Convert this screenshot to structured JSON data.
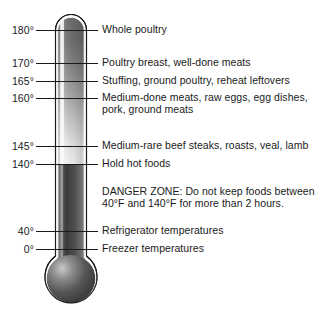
{
  "figure": {
    "background_color": "#ffffff",
    "text_color": "#1a1a1a"
  },
  "thermometer": {
    "outline_color": "#1a1a1a",
    "tube_top_color": "#6a6a6a",
    "tube_mid_color": "#f2f2f2",
    "tube_bottom_color": "#4a4a4a",
    "highlight_color": "#f5f5f5",
    "bulb_color": "#4a4a4a",
    "bulb_highlight_color": "#d8d8d8",
    "scale_unit": "°"
  },
  "readings": [
    {
      "temperature": "180°",
      "description": "Whole poultry",
      "y": 30
    },
    {
      "temperature": "170°",
      "description": "Poultry breast, well-done meats",
      "y": 63
    },
    {
      "temperature": "165°",
      "description": "Stuffing, ground poultry, reheat leftovers",
      "y": 81
    },
    {
      "temperature": "160°",
      "description": "Medium-done meats, raw eggs, egg dishes,\npork, ground meats",
      "y": 98
    },
    {
      "temperature": "145°",
      "description": "Medium-rare beef steaks, roasts, veal, lamb",
      "y": 146
    },
    {
      "temperature": "140°",
      "description": "Hold hot foods",
      "y": 164
    },
    {
      "temperature": "40°",
      "description": "Refrigerator temperatures",
      "y": 231
    },
    {
      "temperature": "0°",
      "description": "Freezer temperatures",
      "y": 249
    }
  ],
  "danger_zone": {
    "text": "DANGER ZONE: Do not keep foods between\n40°F and 140°F for more than 2 hours.",
    "y": 185
  }
}
